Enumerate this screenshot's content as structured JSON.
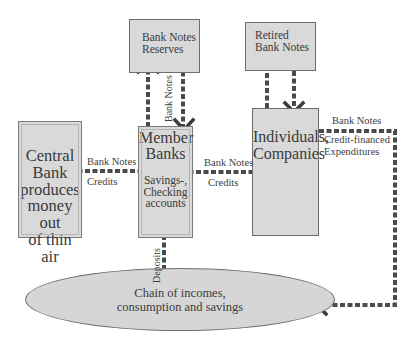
{
  "nodes": {
    "central_bank": {
      "lines": [
        "Central",
        "Bank",
        "produces",
        "money out",
        "of thin air"
      ]
    },
    "member_banks": {
      "lines": [
        "Member",
        "Banks"
      ],
      "sub_lines": [
        "Savings-,",
        "Checking",
        "accounts"
      ]
    },
    "bank_notes_reserves": {
      "lines": [
        "Bank Notes",
        "Reserves"
      ]
    },
    "retired_bank_notes": {
      "lines": [
        "Retired",
        "Bank Notes"
      ]
    },
    "individuals_companies": {
      "lines": [
        "Individuals,",
        "Companies"
      ]
    },
    "chain": {
      "lines": [
        "Chain of incomes,",
        "consumption and savings"
      ]
    }
  },
  "edge_labels": {
    "cb_to_mb_top": "Bank Notes",
    "cb_to_mb_bottom": "Credits",
    "mb_reserves_vertical": "Bank Notes",
    "mb_to_ic_top": "Bank Notes",
    "mb_to_ic_bottom": "Credits",
    "ic_to_chain_top": "Bank Notes",
    "ic_to_chain_bottom_1": "Credit-financed",
    "ic_to_chain_bottom_2": "Expenditures",
    "chain_to_mb": "Deposits"
  },
  "colors": {
    "box_fill": "#d9d9d9",
    "box_border": "#7a7a7a",
    "arrow": "#4a4a4a",
    "text": "#3a3a3a",
    "background": "#ffffff"
  }
}
